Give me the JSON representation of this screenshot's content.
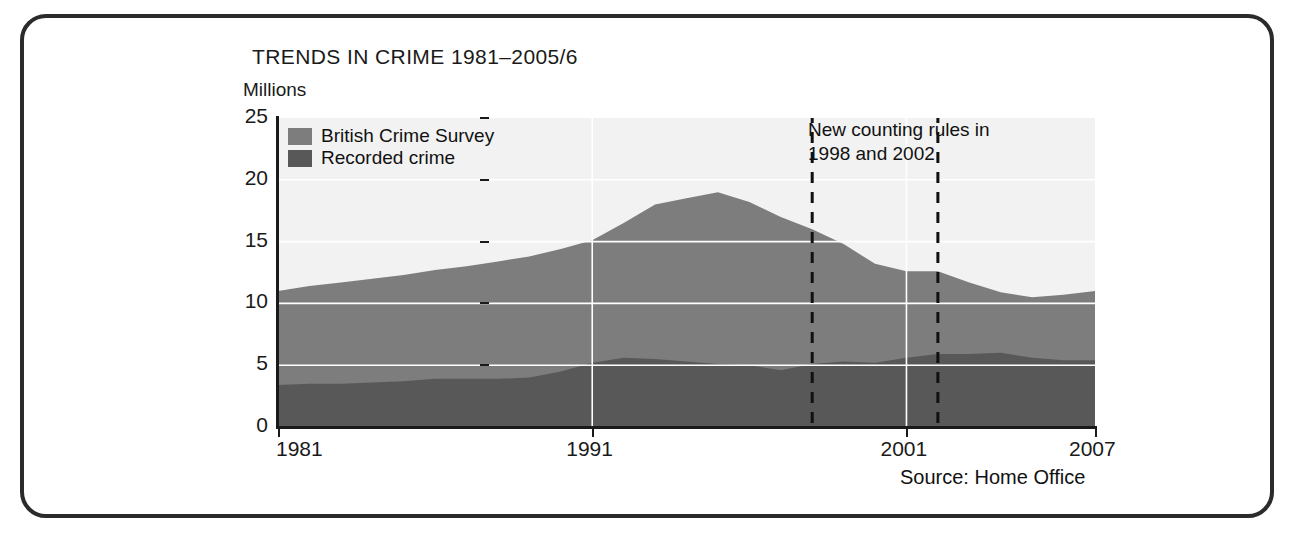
{
  "figure": {
    "title": "TRENDS IN CRIME 1981–2005/6",
    "y_axis_caption": "Millions",
    "source": "Source: Home Office",
    "annotation_line1": "New counting rules in",
    "annotation_line2": "1998 and 2002"
  },
  "colors": {
    "british_crime_survey": "#7d7d7d",
    "recorded_crime": "#585858",
    "gridline": "#ffffff",
    "axis": "#1a1a1a",
    "frame": "#2b2b2b",
    "plot_background": "#f2f2f2"
  },
  "legend": {
    "items": [
      {
        "label": "British Crime Survey",
        "color": "#7d7d7d"
      },
      {
        "label": "Recorded crime",
        "color": "#585858"
      }
    ]
  },
  "chart_data": {
    "type": "area",
    "stacked": true,
    "title": "TRENDS IN CRIME 1981–2005/6",
    "xlabel": "",
    "ylabel": "Millions",
    "xlim": [
      1981,
      2007
    ],
    "ylim": [
      0,
      25
    ],
    "grid": true,
    "legend_position": "top-left inside plot",
    "y_ticks": [
      0,
      5,
      10,
      15,
      20,
      25
    ],
    "x_ticks": [
      1981,
      1991,
      2001,
      2007
    ],
    "x_tick_labels": [
      "1981",
      "1991",
      "2001",
      "2007"
    ],
    "x_gridlines": [
      1991,
      2001
    ],
    "y_gridlines": [
      5,
      10,
      15,
      20
    ],
    "annotations": [
      {
        "text": "New counting rules in 1998 and 2002",
        "x": 1998,
        "style": "dashed-vertical"
      },
      {
        "text": "",
        "x": 2002,
        "style": "dashed-vertical"
      }
    ],
    "x": [
      1981,
      1982,
      1983,
      1984,
      1985,
      1986,
      1987,
      1988,
      1989,
      1990,
      1991,
      1992,
      1993,
      1994,
      1995,
      1996,
      1997,
      1998,
      1999,
      2000,
      2001,
      2002,
      2003,
      2004,
      2005,
      2006,
      2007
    ],
    "series": [
      {
        "name": "Recorded crime",
        "color": "#585858",
        "values": [
          3.4,
          3.5,
          3.5,
          3.6,
          3.7,
          3.9,
          3.9,
          3.9,
          4.0,
          4.5,
          5.2,
          5.6,
          5.5,
          5.3,
          5.1,
          5.0,
          4.6,
          5.1,
          5.3,
          5.2,
          5.6,
          5.9,
          5.9,
          6.0,
          5.6,
          5.4,
          5.4
        ]
      },
      {
        "name": "British Crime Survey",
        "color": "#7d7d7d",
        "values": [
          11.0,
          11.4,
          11.7,
          12.0,
          12.3,
          12.7,
          13.0,
          13.4,
          13.8,
          14.4,
          15.1,
          16.5,
          18.0,
          18.5,
          19.0,
          18.2,
          17.0,
          16.0,
          14.8,
          13.2,
          12.6,
          12.6,
          11.7,
          10.9,
          10.5,
          10.7,
          11.0
        ]
      }
    ],
    "series_note": "British Crime Survey values are the total (top of stack); Recorded crime is the lower band."
  }
}
